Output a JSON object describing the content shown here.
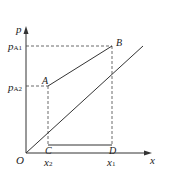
{
  "diagram": {
    "axes": {
      "y_label": "p",
      "x_label": "x",
      "origin_label": "O"
    },
    "points": {
      "A": "A",
      "B": "B",
      "C": "C",
      "D": "D"
    },
    "y_ticks": [
      {
        "main": "p",
        "sub": "A1"
      },
      {
        "main": "p",
        "sub": "A2"
      }
    ],
    "x_ticks": [
      {
        "main": "x",
        "sub": "2"
      },
      {
        "main": "x",
        "sub": "1"
      }
    ],
    "colors": {
      "line": "#333333",
      "dashed": "#444444"
    }
  }
}
